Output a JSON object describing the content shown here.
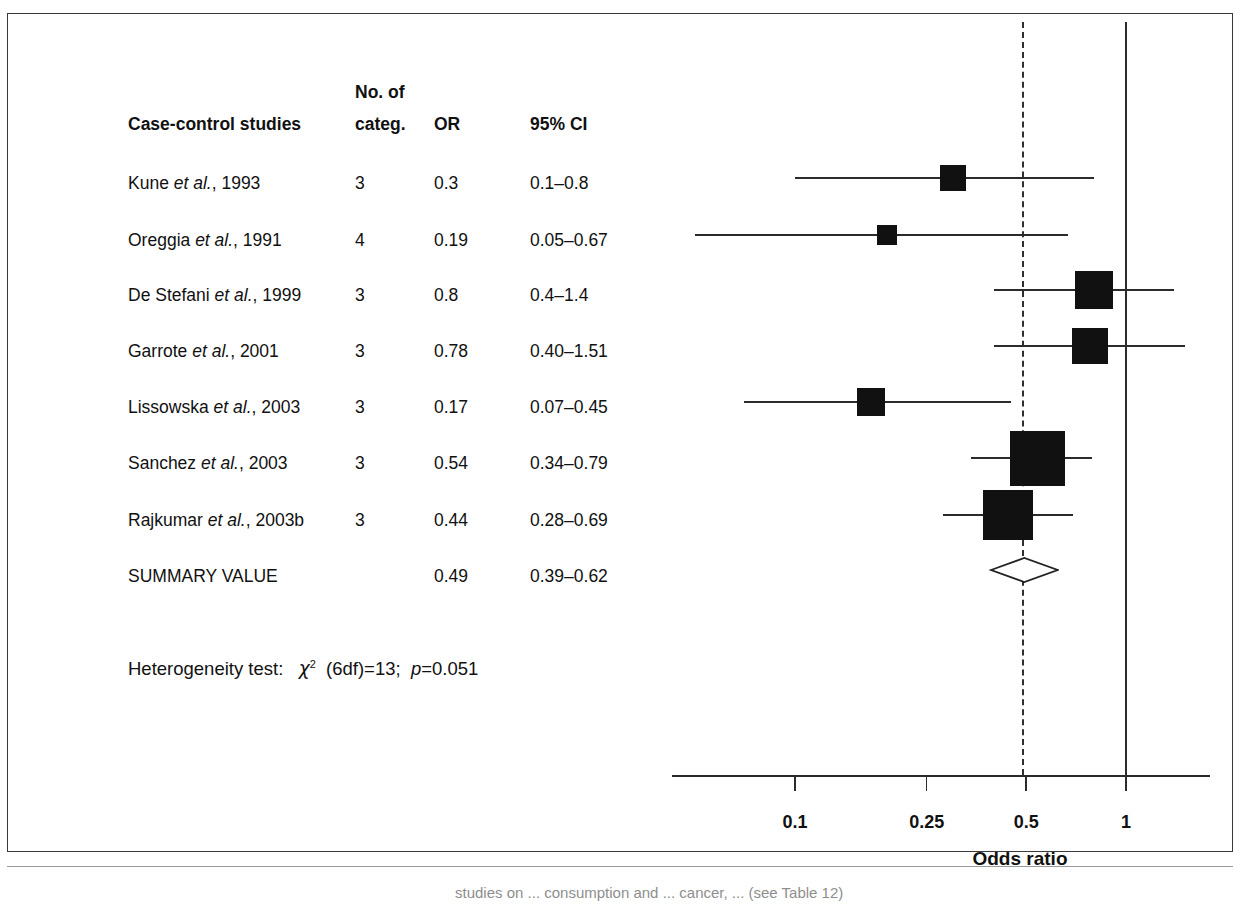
{
  "figure": {
    "caption_partial": "studies on ... consumption and ... cancer, ... (see Table 12)"
  },
  "table": {
    "headers": {
      "study": "Case-control studies",
      "categories_line1": "No. of",
      "categories_line2": "categ.",
      "or": "OR",
      "ci": "95% CI"
    },
    "rows": [
      {
        "study_name": "Kune",
        "study_suffix": "et al., 1993",
        "categ": "3",
        "or": "0.3",
        "ci": "0.1–0.8"
      },
      {
        "study_name": "Oreggia",
        "study_suffix": "et al., 1991",
        "categ": "4",
        "or": "0.19",
        "ci": "0.05–0.67"
      },
      {
        "study_name": "De Stefani",
        "study_suffix": "et al., 1999",
        "categ": "3",
        "or": "0.8",
        "ci": "0.4–1.4"
      },
      {
        "study_name": "Garrote",
        "study_suffix": "et al., 2001",
        "categ": "3",
        "or": "0.78",
        "ci": "0.40–1.51"
      },
      {
        "study_name": "Lissowska",
        "study_suffix": "et al., 2003",
        "categ": "3",
        "or": "0.17",
        "ci": "0.07–0.45"
      },
      {
        "study_name": "Sanchez",
        "study_suffix": "et al., 2003",
        "categ": "3",
        "or": "0.54",
        "ci": "0.34–0.79"
      },
      {
        "study_name": "Rajkumar",
        "study_suffix": "et al., 2003b",
        "categ": "3",
        "or": "0.44",
        "ci": "0.28–0.69"
      },
      {
        "study_name": "SUMMARY VALUE",
        "study_suffix": "",
        "categ": "",
        "or": "0.49",
        "ci": "0.39–0.62"
      }
    ]
  },
  "heterogeneity": {
    "label": "Heterogeneity test:",
    "chi_symbol": "χ",
    "chi_exponent": "2",
    "df_text": "(6df)=13;",
    "p_symbol": "p",
    "p_value": "=0.051"
  },
  "axis": {
    "title": "Odds ratio",
    "tick_labels": [
      "0.1",
      "0.25",
      "0.5",
      "1"
    ],
    "tick_values": [
      0.1,
      0.25,
      0.5,
      1
    ],
    "scale": "log",
    "null_line_value": 1,
    "summary_line_value": 0.49
  },
  "chart_data": {
    "type": "forest",
    "title": "",
    "xlabel": "Odds ratio",
    "ylabel": "",
    "xscale": "log",
    "xlim": [
      0.06,
      1.6
    ],
    "xticks": [
      0.1,
      0.25,
      0.5,
      1
    ],
    "xticklabels": [
      "0.1",
      "0.25",
      "0.5",
      "1"
    ],
    "grid": false,
    "reference_line": 1,
    "summary_dashed_line": 0.49,
    "legend": "none",
    "studies": [
      {
        "label": "Kune et al., 1993",
        "categories": 3,
        "or": 0.3,
        "ci_low": 0.1,
        "ci_high": 0.8,
        "weight_box_px": 26
      },
      {
        "label": "Oreggia et al., 1991",
        "categories": 4,
        "or": 0.19,
        "ci_low": 0.05,
        "ci_high": 0.67,
        "weight_box_px": 20
      },
      {
        "label": "De Stefani et al., 1999",
        "categories": 3,
        "or": 0.8,
        "ci_low": 0.4,
        "ci_high": 1.4,
        "weight_box_px": 38
      },
      {
        "label": "Garrote et al., 2001",
        "categories": 3,
        "or": 0.78,
        "ci_low": 0.4,
        "ci_high": 1.51,
        "weight_box_px": 36
      },
      {
        "label": "Lissowska et al., 2003",
        "categories": 3,
        "or": 0.17,
        "ci_low": 0.07,
        "ci_high": 0.45,
        "weight_box_px": 28
      },
      {
        "label": "Sanchez et al., 2003",
        "categories": 3,
        "or": 0.54,
        "ci_low": 0.34,
        "ci_high": 0.79,
        "weight_box_px": 55
      },
      {
        "label": "Rajkumar et al., 2003b",
        "categories": 3,
        "or": 0.44,
        "ci_low": 0.28,
        "ci_high": 0.69,
        "weight_box_px": 50
      }
    ],
    "summary": {
      "label": "SUMMARY VALUE",
      "or": 0.49,
      "ci_low": 0.39,
      "ci_high": 0.62,
      "shape": "diamond",
      "filled": false
    },
    "heterogeneity_text": "Heterogeneity test: χ² (6df)=13; p=0.051"
  },
  "colors": {
    "marker": "#111111",
    "line": "#2b2b2b",
    "frame": "#3a3a3a",
    "text": "#111111"
  }
}
